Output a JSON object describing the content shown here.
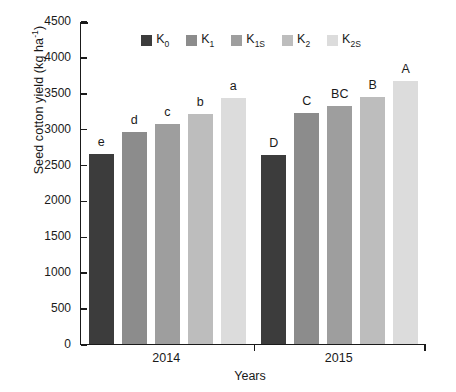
{
  "chart_data": {
    "type": "bar",
    "title": "",
    "xlabel": "Years",
    "ylabel": "Seed cotton yield (kg ha-1)",
    "ylabel_main": "Seed cotton yield (kg ha",
    "ylabel_sup": "-1",
    "ylabel_tail": ")",
    "categories": [
      "2014",
      "2015"
    ],
    "ylim": [
      0,
      4500
    ],
    "yticks": [
      4500,
      4000,
      3500,
      3000,
      2500,
      2000,
      1500,
      1000,
      500,
      0
    ],
    "grid": false,
    "legend_position": "top-center",
    "series": [
      {
        "name": "K0",
        "label_main": "K",
        "label_sub": "0",
        "color": "#3c3c3c",
        "values": [
          2650,
          2640
        ],
        "sig_letters": [
          "e",
          "D"
        ]
      },
      {
        "name": "K1",
        "label_main": "K",
        "label_sub": "1",
        "color": "#8c8c8c",
        "values": [
          2955,
          3220
        ],
        "sig_letters": [
          "d",
          "C"
        ]
      },
      {
        "name": "K1S",
        "label_main": "K",
        "label_sub": "1S",
        "color": "#9e9e9e",
        "values": [
          3060,
          3320
        ],
        "sig_letters": [
          "c",
          "BC"
        ]
      },
      {
        "name": "K2",
        "label_main": "K",
        "label_sub": "2",
        "color": "#bdbdbd",
        "values": [
          3200,
          3440
        ],
        "sig_letters": [
          "b",
          "B"
        ]
      },
      {
        "name": "K2S",
        "label_main": "K",
        "label_sub": "2S",
        "color": "#dcdcdc",
        "values": [
          3430,
          3660
        ],
        "sig_letters": [
          "a",
          "A"
        ]
      }
    ]
  },
  "axis": {
    "y_tick_labels": [
      "4500",
      "4000",
      "3500",
      "3000",
      "2500",
      "2000",
      "1500",
      "1000",
      "500",
      "0"
    ],
    "x_group_labels": [
      "2014",
      "2015"
    ],
    "x_axis_title": "Years"
  }
}
